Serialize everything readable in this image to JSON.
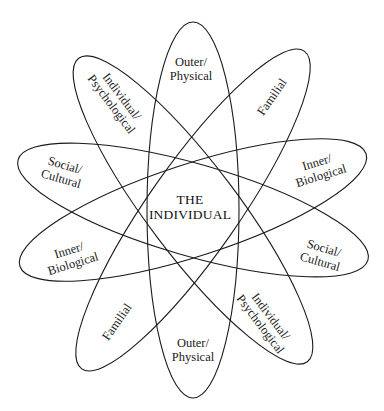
{
  "diagram": {
    "center_label": {
      "line1": "THE",
      "line2": "INDIVIDUAL"
    },
    "colors": {
      "stroke": "#1a1a1a",
      "background": "#ffffff",
      "text": "#1a1a1a"
    },
    "ellipses": [
      {
        "name": "Outer/Physical",
        "rotation_deg": 0
      },
      {
        "name": "Familial",
        "rotation_deg": 35
      },
      {
        "name": "Inner/Biological",
        "rotation_deg": 72
      },
      {
        "name": "Social/Cultural",
        "rotation_deg": -74
      },
      {
        "name": "Individual/Psychological",
        "rotation_deg": -37
      }
    ],
    "labels": {
      "outer_top": {
        "line1": "Outer/",
        "line2": "Physical"
      },
      "outer_bottom": {
        "line1": "Outer/",
        "line2": "Physical"
      },
      "familial_top": {
        "line1": "Familial"
      },
      "familial_bottom": {
        "line1": "Familial"
      },
      "indiv_top": {
        "line1": "Individual/",
        "line2": "Psychological"
      },
      "indiv_bottom": {
        "line1": "Individual/",
        "line2": "Psychological"
      },
      "social_left": {
        "line1": "Social/",
        "line2": "Cultural"
      },
      "social_right": {
        "line1": "Social/",
        "line2": "Cultural"
      },
      "inner_left": {
        "line1": "Inner/",
        "line2": "Biological"
      },
      "inner_right": {
        "line1": "Inner/",
        "line2": "Biological"
      }
    }
  }
}
